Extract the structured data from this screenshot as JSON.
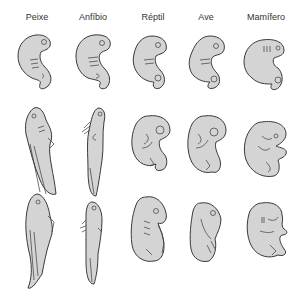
{
  "figure": {
    "columns": [
      {
        "label": "Peixe"
      },
      {
        "label": "Anfíbio"
      },
      {
        "label": "Réptil"
      },
      {
        "label": "Ave"
      },
      {
        "label": "Mamífero"
      }
    ],
    "rows": [
      {
        "stage": "early"
      },
      {
        "stage": "middle"
      },
      {
        "stage": "late"
      }
    ],
    "colors": {
      "embryo_fill": "#d4d4d4",
      "outline": "#3a3a3a",
      "background": "#ffffff"
    }
  }
}
